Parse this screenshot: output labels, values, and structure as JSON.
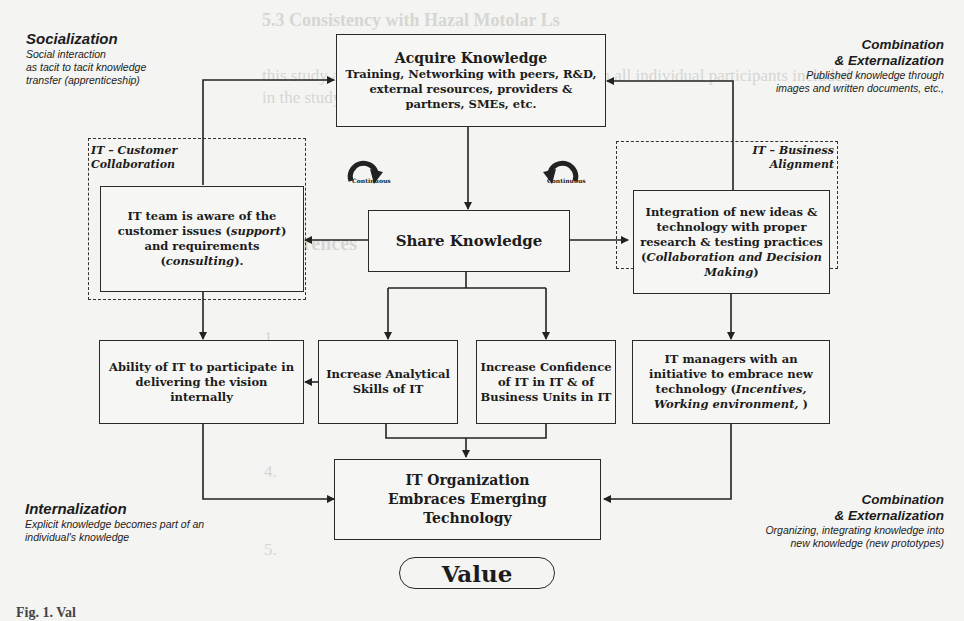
{
  "corners": {
    "top_left": {
      "title": "Socialization",
      "lines": [
        "Social interaction",
        "as tacit to tacit knowledge",
        "transfer (apprenticeship)"
      ]
    },
    "top_right": {
      "title1": "Combination",
      "title2": "& Externalization",
      "lines": [
        "Published knowledge through",
        "images and written documents, etc.,"
      ]
    },
    "bottom_left": {
      "title": "Internalization",
      "lines": [
        "Explicit knowledge becomes part of an",
        "individual's knowledge"
      ]
    },
    "bottom_right": {
      "title1": "Combination",
      "title2": "& Externalization",
      "lines": [
        "Organizing, integrating knowledge into",
        "new knowledge (new prototypes)"
      ]
    }
  },
  "groups": {
    "left": {
      "line1": "IT – Customer",
      "line2": "Collaboration"
    },
    "right": {
      "line1": "IT – Business",
      "line2": "Alignment"
    }
  },
  "cycle_labels": {
    "left": "Continuous",
    "right": "Continuous"
  },
  "nodes": {
    "acquire": {
      "title": "Acquire Knowledge",
      "l1": "Training, Networking with peers, R&D,",
      "l2": "external resources, providers &",
      "l3": "partners, SMEs, etc."
    },
    "share": {
      "title": "Share Knowledge"
    },
    "customer": {
      "l1": "IT team is aware of the",
      "l2a": "customer issues (",
      "l2i": "support",
      "l2b": ")",
      "l3": "and requirements",
      "l4a": "(",
      "l4i": "consulting",
      "l4b": ")."
    },
    "integration": {
      "l1": "Integration of new ideas &",
      "l2": "technology with proper",
      "l3": "research & testing practices",
      "l4a": "(",
      "l4i": "Collaboration and Decision",
      "l5i": "Making",
      "l5b": ")"
    },
    "ability": {
      "l1": "Ability of IT to participate in",
      "l2": "delivering the vision",
      "l3": "internally"
    },
    "analytical": {
      "l1": "Increase Analytical",
      "l2": "Skills of IT"
    },
    "confidence": {
      "l1": "Increase Confidence",
      "l2": "of IT in IT & of",
      "l3": "Business Units in IT"
    },
    "managers": {
      "l1": "IT managers with an",
      "l2": "initiative to embrace new",
      "l3a": "technology (",
      "l3i": "Incentives,",
      "l4i": "Working environment, ",
      "l4b": ")"
    },
    "organization": {
      "l1": "IT Organization",
      "l2": "Embraces Emerging",
      "l3": "Technology"
    },
    "value": {
      "label": "Value"
    }
  },
  "caption": {
    "text": "Fig. 1. Val"
  },
  "background_bleed": [
    "5.3 Consistency with Hazal Motolar Ls",
    "this study and informed consent was obtained from all individual participants included",
    "in the study.",
    "References",
    "1.",
    "2.",
    "3.",
    "4.",
    "5."
  ]
}
